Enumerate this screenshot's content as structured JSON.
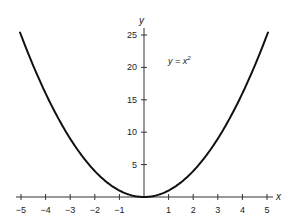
{
  "chart_data": {
    "type": "line",
    "title": "",
    "xlabel": "x",
    "ylabel": "y",
    "xlim": [
      -5,
      5
    ],
    "ylim": [
      0,
      25
    ],
    "grid": false,
    "legend": null,
    "annotations": [
      {
        "text": "y = x²",
        "x": 1.5,
        "y": 21
      }
    ],
    "x_ticks": [
      -5,
      -4,
      -3,
      -2,
      -1,
      1,
      2,
      3,
      4,
      5
    ],
    "y_ticks": [
      5,
      10,
      15,
      20,
      25
    ],
    "series": [
      {
        "name": "y = x^2",
        "x": [
          -5,
          -4,
          -3,
          -2,
          -1,
          0,
          1,
          2,
          3,
          4,
          5
        ],
        "values": [
          25,
          16,
          9,
          4,
          1,
          0,
          1,
          4,
          9,
          16,
          25
        ]
      }
    ]
  },
  "labels": {
    "x_axis": "x",
    "y_axis": "y",
    "equation_main": "y = x",
    "equation_exp": "2",
    "x_ticks": [
      "−5",
      "−4",
      "−3",
      "−2",
      "−1",
      "1",
      "2",
      "3",
      "4",
      "5"
    ],
    "y_ticks": [
      "5",
      "10",
      "15",
      "20",
      "25"
    ]
  }
}
